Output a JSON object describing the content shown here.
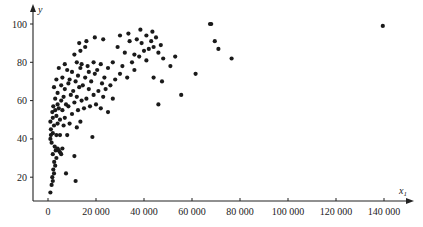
{
  "chart_data": {
    "type": "scatter",
    "title": "",
    "xlabel": "x1",
    "xlabel_main": "x",
    "xlabel_sub": "1",
    "ylabel": "y",
    "xlim": [
      -4000,
      152000
    ],
    "ylim": [
      8,
      108
    ],
    "grid": false,
    "legend": null,
    "x_ticks": [
      0,
      20000,
      40000,
      60000,
      80000,
      100000,
      120000,
      140000
    ],
    "x_tick_labels": [
      "0",
      "20 000",
      "40 000",
      "60 000",
      "80 000",
      "100 000",
      "120 000",
      "140 000"
    ],
    "y_ticks": [
      20,
      40,
      60,
      80,
      100
    ],
    "y_tick_labels": [
      "20",
      "40",
      "60",
      "80",
      "100"
    ],
    "point_color": "#1a1a1a",
    "points": [
      [
        1000,
        12
      ],
      [
        1500,
        16
      ],
      [
        2000,
        18
      ],
      [
        1800,
        20
      ],
      [
        2500,
        22
      ],
      [
        2200,
        24
      ],
      [
        3000,
        26
      ],
      [
        2600,
        28
      ],
      [
        3500,
        30
      ],
      [
        2000,
        32
      ],
      [
        3200,
        34
      ],
      [
        4000,
        35
      ],
      [
        2800,
        36
      ],
      [
        4500,
        34
      ],
      [
        1500,
        38
      ],
      [
        5000,
        33
      ],
      [
        6000,
        35
      ],
      [
        5500,
        32
      ],
      [
        1000,
        40
      ],
      [
        1200,
        42
      ],
      [
        2000,
        43
      ],
      [
        3500,
        42
      ],
      [
        5000,
        42
      ],
      [
        8000,
        42
      ],
      [
        11000,
        31
      ],
      [
        7500,
        22
      ],
      [
        11500,
        18
      ],
      [
        18500,
        41
      ],
      [
        1200,
        45
      ],
      [
        2500,
        47
      ],
      [
        4000,
        48
      ],
      [
        6500,
        47
      ],
      [
        9000,
        48
      ],
      [
        12000,
        46
      ],
      [
        1000,
        49
      ],
      [
        2000,
        51
      ],
      [
        3500,
        52
      ],
      [
        5000,
        50
      ],
      [
        7000,
        51
      ],
      [
        10000,
        53
      ],
      [
        13500,
        49
      ],
      [
        1800,
        54
      ],
      [
        3000,
        55
      ],
      [
        4500,
        56
      ],
      [
        6000,
        55
      ],
      [
        8500,
        57
      ],
      [
        12500,
        55
      ],
      [
        15000,
        56
      ],
      [
        2200,
        57
      ],
      [
        4000,
        58
      ],
      [
        5500,
        60
      ],
      [
        7500,
        58
      ],
      [
        11000,
        59
      ],
      [
        14000,
        60
      ],
      [
        17500,
        57
      ],
      [
        20000,
        58
      ],
      [
        22000,
        56
      ],
      [
        25000,
        54
      ],
      [
        3000,
        61
      ],
      [
        6500,
        62
      ],
      [
        9500,
        63
      ],
      [
        12000,
        62
      ],
      [
        16000,
        61
      ],
      [
        19000,
        63
      ],
      [
        23000,
        62
      ],
      [
        27000,
        61
      ],
      [
        4000,
        64
      ],
      [
        7000,
        66
      ],
      [
        10500,
        65
      ],
      [
        13000,
        67
      ],
      [
        17000,
        66
      ],
      [
        21000,
        65
      ],
      [
        24000,
        66
      ],
      [
        2500,
        67
      ],
      [
        5500,
        68
      ],
      [
        8500,
        69
      ],
      [
        11500,
        70
      ],
      [
        14500,
        68
      ],
      [
        18000,
        70
      ],
      [
        22500,
        69
      ],
      [
        26000,
        68
      ],
      [
        3500,
        71
      ],
      [
        6000,
        72
      ],
      [
        9000,
        71
      ],
      [
        12500,
        73
      ],
      [
        15500,
        72
      ],
      [
        19500,
        74
      ],
      [
        23500,
        72
      ],
      [
        28000,
        71
      ],
      [
        4500,
        77
      ],
      [
        8000,
        76
      ],
      [
        10000,
        75
      ],
      [
        13500,
        77
      ],
      [
        17000,
        75
      ],
      [
        20500,
        76
      ],
      [
        25000,
        77
      ],
      [
        30000,
        74
      ],
      [
        33000,
        72
      ],
      [
        7000,
        79
      ],
      [
        12000,
        80
      ],
      [
        14000,
        79
      ],
      [
        16500,
        78
      ],
      [
        19000,
        80
      ],
      [
        22000,
        79
      ],
      [
        27000,
        80
      ],
      [
        31000,
        78
      ],
      [
        35000,
        80
      ],
      [
        11000,
        84
      ],
      [
        13500,
        86
      ],
      [
        15500,
        88
      ],
      [
        13000,
        90
      ],
      [
        16000,
        91
      ],
      [
        19500,
        93
      ],
      [
        23000,
        92
      ],
      [
        29000,
        88
      ],
      [
        32000,
        85
      ],
      [
        36000,
        84
      ],
      [
        38000,
        83
      ],
      [
        40000,
        86
      ],
      [
        42000,
        87
      ],
      [
        44000,
        88
      ],
      [
        46000,
        85
      ],
      [
        34000,
        91
      ],
      [
        37000,
        92
      ],
      [
        39000,
        90
      ],
      [
        41000,
        94
      ],
      [
        43000,
        91
      ],
      [
        45000,
        93
      ],
      [
        47000,
        89
      ],
      [
        43500,
        96
      ],
      [
        38500,
        97
      ],
      [
        33500,
        95
      ],
      [
        30000,
        94
      ],
      [
        41000,
        81
      ],
      [
        48000,
        82
      ],
      [
        51000,
        78
      ],
      [
        53000,
        83
      ],
      [
        36000,
        76
      ],
      [
        44000,
        72
      ],
      [
        47500,
        70
      ],
      [
        46000,
        58
      ],
      [
        55500,
        63
      ],
      [
        61500,
        74
      ],
      [
        67500,
        100
      ],
      [
        68000,
        100
      ],
      [
        69500,
        91
      ],
      [
        71000,
        87
      ],
      [
        76500,
        82
      ],
      [
        139500,
        99
      ]
    ]
  }
}
